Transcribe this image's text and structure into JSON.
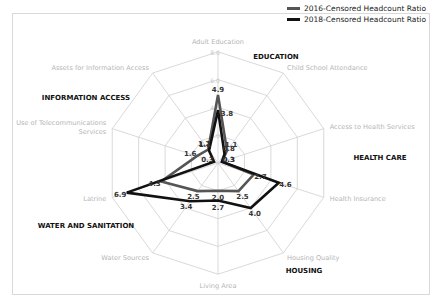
{
  "chart_data": {
    "type": "radar",
    "title": "",
    "axes": [
      "Adult Education",
      "Child School Attendance",
      "Access to Health Services",
      "Health Insurance",
      "Housing Quality",
      "Living Area",
      "Water Sources",
      "Latrine",
      "Use of Telecommunications Services",
      "Assets for Information Access"
    ],
    "rings": [
      2.0,
      4.0,
      6.0,
      8.0
    ],
    "ring_labels": [
      "2.0",
      "4.0",
      "6.0",
      "8.0"
    ],
    "range": [
      0,
      8
    ],
    "series": [
      {
        "name": "2016-Censored Headcount Ratio",
        "color": "#555555",
        "values": [
          4.9,
          1.1,
          0.3,
          2.7,
          2.5,
          2.0,
          2.5,
          4.3,
          1.6,
          1.2
        ]
      },
      {
        "name": "2018-Censored Headcount Ratio",
        "color": "#111111",
        "values": [
          3.8,
          0.8,
          0.3,
          4.6,
          4.0,
          2.7,
          3.4,
          6.9,
          0.3,
          1.1
        ]
      }
    ],
    "groups": [
      {
        "label": "EDUCATION",
        "x": 276,
        "y": 59
      },
      {
        "label": "HEALTH CARE",
        "x": 380,
        "y": 160
      },
      {
        "label": "HOUSING",
        "x": 304,
        "y": 273
      },
      {
        "label": "WATER AND SANITATION",
        "x": 86,
        "y": 228
      },
      {
        "label": "INFORMATION ACCESS",
        "x": 86,
        "y": 100
      }
    ],
    "legend_position": "top-right",
    "grid": true
  },
  "legend": {
    "items": [
      {
        "label": "2016-Censored Headcount Ratio",
        "color": "#555555"
      },
      {
        "label": "2018-Censored Headcount Ratio",
        "color": "#111111"
      }
    ]
  }
}
